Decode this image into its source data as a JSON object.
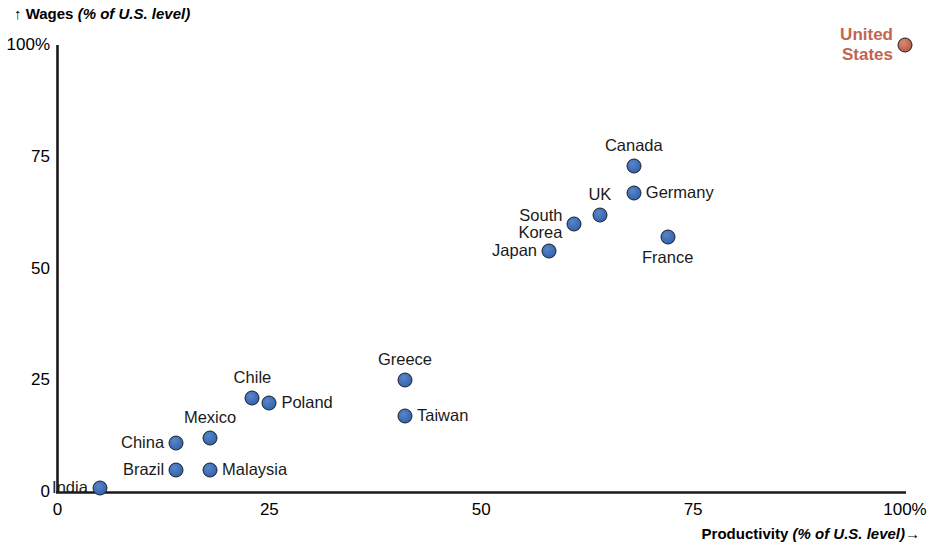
{
  "chart_data": {
    "type": "scatter",
    "title": "",
    "xlabel": "Productivity",
    "xlabel_unit": "(% of U.S. level)",
    "ylabel": "Wages",
    "ylabel_unit": "(% of U.S. level)",
    "xlim": [
      0,
      100
    ],
    "ylim": [
      0,
      100
    ],
    "grid": false,
    "legend": "none",
    "x_ticks": [
      "0",
      "25",
      "50",
      "75",
      "100%"
    ],
    "x_tick_values": [
      0,
      25,
      50,
      75,
      100
    ],
    "y_ticks": [
      "0",
      "25",
      "50",
      "75",
      "100%"
    ],
    "y_tick_values": [
      0,
      25,
      50,
      75,
      100
    ],
    "series": [
      {
        "name": "Countries",
        "color": "#3b6cb5",
        "points": [
          {
            "label": "India",
            "x": 5,
            "y": 1,
            "label_pos": "left"
          },
          {
            "label": "Brazil",
            "x": 14,
            "y": 5,
            "label_pos": "left"
          },
          {
            "label": "Malaysia",
            "x": 18,
            "y": 5,
            "label_pos": "right"
          },
          {
            "label": "China",
            "x": 14,
            "y": 11,
            "label_pos": "left"
          },
          {
            "label": "Mexico",
            "x": 18,
            "y": 12,
            "label_pos": "top"
          },
          {
            "label": "Chile",
            "x": 23,
            "y": 21,
            "label_pos": "top"
          },
          {
            "label": "Poland",
            "x": 25,
            "y": 20,
            "label_pos": "right"
          },
          {
            "label": "Greece",
            "x": 41,
            "y": 25,
            "label_pos": "top"
          },
          {
            "label": "Taiwan",
            "x": 41,
            "y": 17,
            "label_pos": "right"
          },
          {
            "label": "Japan",
            "x": 58,
            "y": 54,
            "label_pos": "left"
          },
          {
            "label": "South\nKorea",
            "x": 61,
            "y": 60,
            "label_pos": "left"
          },
          {
            "label": "UK",
            "x": 64,
            "y": 62,
            "label_pos": "top"
          },
          {
            "label": "Germany",
            "x": 68,
            "y": 67,
            "label_pos": "right"
          },
          {
            "label": "Canada",
            "x": 68,
            "y": 73,
            "label_pos": "top"
          },
          {
            "label": "France",
            "x": 72,
            "y": 57,
            "label_pos": "bottom"
          }
        ]
      },
      {
        "name": "Reference",
        "color": "#c1664f",
        "highlight": true,
        "points": [
          {
            "label": "United\nStates",
            "x": 100,
            "y": 100,
            "label_pos": "left"
          }
        ]
      }
    ]
  },
  "axes": {
    "y_title_text": "Wages",
    "y_title_unit": "(% of U.S. level)",
    "y_title_arrow": "↑",
    "x_title_text": "Productivity",
    "x_title_unit": "(% of U.S. level)",
    "x_title_arrow": "→"
  },
  "colors": {
    "point_blue": "#3b6cb5",
    "point_red": "#c1664f",
    "axis": "#1a1a1a",
    "background": "#ffffff"
  }
}
